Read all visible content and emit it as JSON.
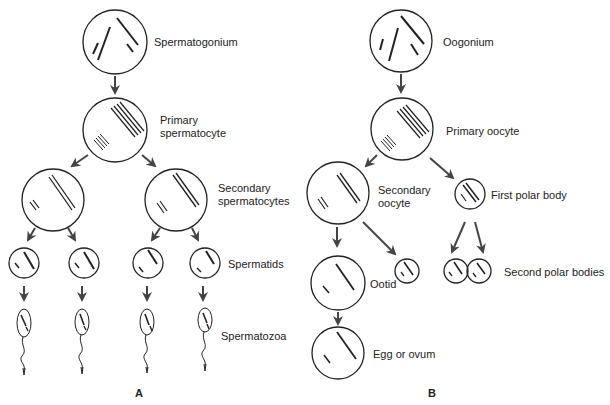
{
  "panel_a": {
    "letter": "A",
    "labels": {
      "spermatogonium": "Spermatogonium",
      "primary_1": "Primary",
      "primary_2": "spermatocyte",
      "secondary_1": "Secondary",
      "secondary_2": "spermatocytes",
      "spermatids": "Spermatids",
      "spermatozoa": "Spermatozoa"
    }
  },
  "panel_b": {
    "letter": "B",
    "labels": {
      "oogonium": "Oogonium",
      "primary_oocyte": "Primary oocyte",
      "secondary_1": "Secondary",
      "secondary_2": "oocyte",
      "first_polar": "First polar body",
      "ootid": "Ootid",
      "second_polar": "Second polar bodies",
      "egg": "Egg or ovum"
    }
  },
  "colors": {
    "stroke": "#222222",
    "arrow": "#555555",
    "background": "#ffffff"
  }
}
